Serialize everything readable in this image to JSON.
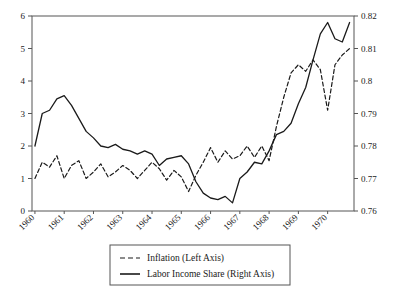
{
  "chart_data": {
    "type": "line",
    "title": "",
    "xlabel": "",
    "ylabel": "",
    "x_tick_labels": [
      "1960",
      "1961",
      "1962",
      "1963",
      "1964",
      "1965",
      "1966",
      "1967",
      "1968",
      "1969",
      "1970"
    ],
    "x_tick_values": [
      1960,
      1961,
      1962,
      1963,
      1964,
      1965,
      1966,
      1967,
      1968,
      1969,
      1970
    ],
    "xlim": [
      1959.9,
      1970.9
    ],
    "left_axis": {
      "name": "Inflation (Left Axis)",
      "ylim": [
        0,
        6
      ],
      "ticks": [
        0,
        1,
        2,
        3,
        4,
        5,
        6
      ],
      "tick_labels": [
        "0",
        "1",
        "2",
        "3",
        "4",
        "5",
        "6"
      ]
    },
    "right_axis": {
      "name": "Labor Income Share (Right Axis)",
      "ylim": [
        0.76,
        0.82
      ],
      "ticks": [
        0.76,
        0.77,
        0.78,
        0.79,
        0.8,
        0.81,
        0.82
      ],
      "tick_labels": [
        "0.76",
        "0.77",
        "0.78",
        "0.79",
        "0.8",
        "0.81",
        "0.82"
      ]
    },
    "grid": false,
    "legend_position": "below-center",
    "series": [
      {
        "name": "Inflation (Left Axis)",
        "axis": "left",
        "style": "dashed",
        "color": "#1a1a1a",
        "x": [
          1960.0,
          1960.25,
          1960.5,
          1960.75,
          1961.0,
          1961.25,
          1961.5,
          1961.75,
          1962.0,
          1962.25,
          1962.5,
          1962.75,
          1963.0,
          1963.25,
          1963.5,
          1963.75,
          1964.0,
          1964.25,
          1964.5,
          1964.75,
          1965.0,
          1965.25,
          1965.5,
          1965.75,
          1966.0,
          1966.25,
          1966.5,
          1966.75,
          1967.0,
          1967.25,
          1967.5,
          1967.75,
          1968.0,
          1968.25,
          1968.5,
          1968.75,
          1969.0,
          1969.25,
          1969.5,
          1969.75,
          1970.0,
          1970.25,
          1970.5,
          1970.75
        ],
        "y": [
          1.0,
          1.5,
          1.35,
          1.7,
          1.0,
          1.4,
          1.55,
          1.0,
          1.2,
          1.45,
          1.05,
          1.2,
          1.4,
          1.25,
          1.0,
          1.25,
          1.5,
          1.3,
          0.95,
          1.25,
          1.05,
          0.6,
          1.1,
          1.5,
          1.95,
          1.5,
          1.85,
          1.6,
          1.7,
          2.0,
          1.65,
          2.0,
          1.55,
          2.6,
          3.5,
          4.25,
          4.5,
          4.3,
          4.65,
          4.35,
          3.1,
          4.5,
          4.8,
          5.0
        ]
      },
      {
        "name": "Labor Income Share (Right Axis)",
        "axis": "right",
        "style": "solid",
        "color": "#1a1a1a",
        "x": [
          1960.0,
          1960.25,
          1960.5,
          1960.75,
          1961.0,
          1961.25,
          1961.5,
          1961.75,
          1962.0,
          1962.25,
          1962.5,
          1962.75,
          1963.0,
          1963.25,
          1963.5,
          1963.75,
          1964.0,
          1964.25,
          1964.5,
          1964.75,
          1965.0,
          1965.25,
          1965.5,
          1965.75,
          1966.0,
          1966.25,
          1966.5,
          1966.75,
          1967.0,
          1967.25,
          1967.5,
          1967.75,
          1968.0,
          1968.25,
          1968.5,
          1968.75,
          1969.0,
          1969.25,
          1969.5,
          1969.75,
          1970.0,
          1970.25,
          1970.5,
          1970.75
        ],
        "y": [
          0.78,
          0.79,
          0.791,
          0.7945,
          0.7955,
          0.7925,
          0.7885,
          0.7845,
          0.7825,
          0.78,
          0.7795,
          0.7805,
          0.779,
          0.7785,
          0.7775,
          0.7785,
          0.7775,
          0.774,
          0.776,
          0.7765,
          0.777,
          0.7745,
          0.769,
          0.7655,
          0.764,
          0.7635,
          0.7645,
          0.7625,
          0.77,
          0.772,
          0.775,
          0.7745,
          0.7785,
          0.7835,
          0.7845,
          0.787,
          0.793,
          0.798,
          0.8065,
          0.8145,
          0.818,
          0.813,
          0.812,
          0.818
        ]
      }
    ],
    "legend_entries": [
      {
        "label": "Inflation (Left Axis)",
        "style": "dashed"
      },
      {
        "label": "Labor Income Share (Right Axis)",
        "style": "solid"
      }
    ]
  }
}
